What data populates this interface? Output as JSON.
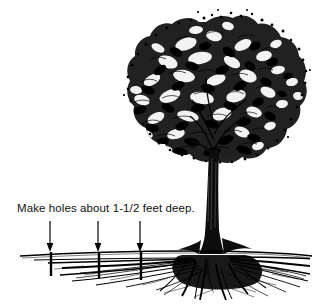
{
  "illustration": {
    "title": "Tree planting diagram",
    "background_color": "#ffffff",
    "ink_color": "#000000",
    "caption": "Make holes about 1-1/2 feet deep.",
    "annotations": {
      "arrow_count": 3,
      "arrow_label": "down-arrow",
      "hole_marker_label": "hole-marker"
    },
    "parts": {
      "canopy": "tree-canopy",
      "trunk": "tree-trunk",
      "roots": "root-system",
      "ground_line": "ground-line"
    }
  }
}
